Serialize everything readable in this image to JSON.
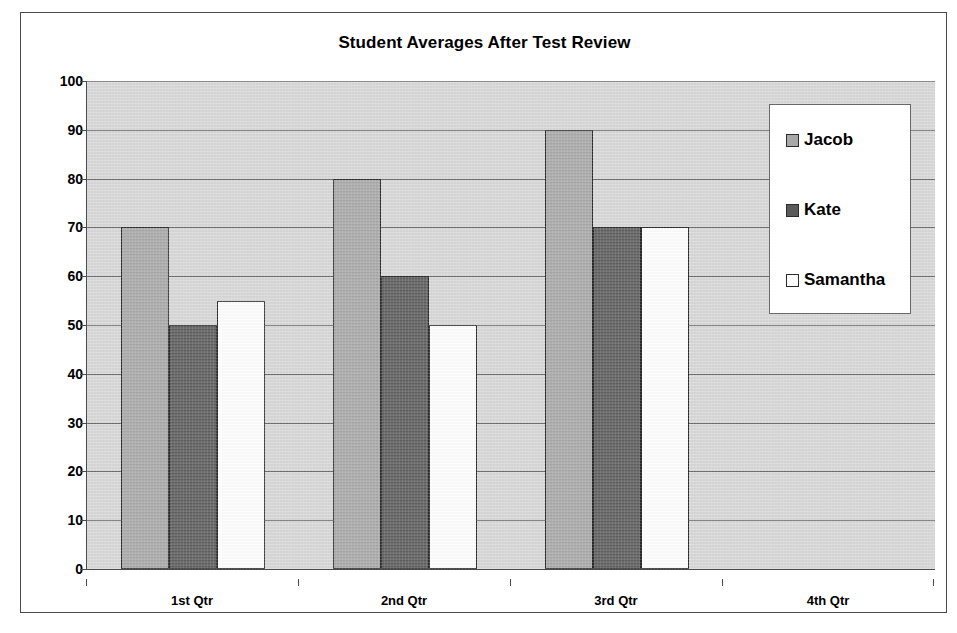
{
  "chart_data": {
    "type": "bar",
    "title": "Student Averages After Test Review",
    "xlabel": "",
    "ylabel": "",
    "categories": [
      "1st Qtr",
      "2nd Qtr",
      "3rd Qtr",
      "4th Qtr"
    ],
    "series": [
      {
        "name": "Jacob",
        "values": [
          70,
          80,
          90,
          null
        ],
        "color": "#a8a8a8"
      },
      {
        "name": "Kate",
        "values": [
          50,
          60,
          70,
          null
        ],
        "color": "#5a5a5a"
      },
      {
        "name": "Samantha",
        "values": [
          55,
          50,
          70,
          null
        ],
        "color": "#ffffff"
      }
    ],
    "ylim": [
      0,
      100
    ],
    "ytick_step": 10,
    "yticks": [
      "100",
      "90",
      "80",
      "70",
      "60",
      "50",
      "40",
      "30",
      "20",
      "10",
      "0"
    ],
    "grid": true,
    "legend_position": "right-inside",
    "plot_background": "#d9d9d9",
    "axis_color": "#4a4a4a",
    "gridline_color": "#6d6d6d",
    "bar_border_color": "#2b2b2b",
    "frame_border_color": "#4a4a4a",
    "page_background": "#ffffff"
  }
}
